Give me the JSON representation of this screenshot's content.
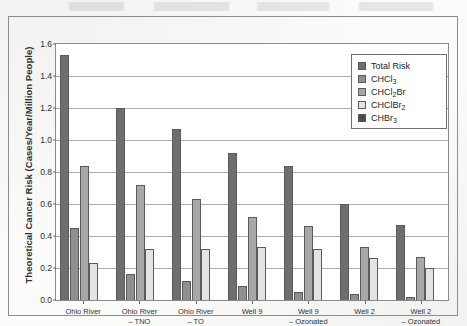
{
  "figure": {
    "y_axis_title": "Theoretical Cancer Risk (Cases/Year/Million People)"
  },
  "legend": {
    "entries": [
      {
        "label": "Total Risk",
        "label_main": "Total Risk",
        "sub": "",
        "label_tail": "",
        "color": "#6e6e6e"
      },
      {
        "label": "CHCl3",
        "label_main": "CHCl",
        "sub": "3",
        "label_tail": "",
        "color": "#8f8f8f"
      },
      {
        "label": "CHCl2Br",
        "label_main": "CHCl",
        "sub": "2",
        "label_tail": "Br",
        "color": "#a8a8a8"
      },
      {
        "label": "CHClBr2",
        "label_main": "CHClBr",
        "sub": "2",
        "label_tail": "",
        "color": "#e3e3e3"
      },
      {
        "label": "CHBr3",
        "label_main": "CHBr",
        "sub": "3",
        "label_tail": "",
        "color": "#4a4a4a"
      }
    ]
  },
  "y_ticks": [
    "0.0",
    "0.2",
    "0.4",
    "0.6",
    "0.8",
    "1.0",
    "1.2",
    "1.4",
    "1.6"
  ],
  "x_labels": [
    {
      "line1": "Ohio River",
      "line2": ""
    },
    {
      "line1": "Ohio River",
      "line2": "– TNO"
    },
    {
      "line1": "Ohio River",
      "line2": "– TO"
    },
    {
      "line1": "Well 9",
      "line2": ""
    },
    {
      "line1": "Well 9",
      "line2": "– Ozonated"
    },
    {
      "line1": "Well 2",
      "line2": ""
    },
    {
      "line1": "Well 2",
      "line2": "– Ozonated"
    }
  ],
  "chart_data": {
    "type": "bar",
    "title": "",
    "xlabel": "",
    "ylabel": "Theoretical Cancer Risk (Cases/Year/Million People)",
    "ylim": [
      0.0,
      1.6
    ],
    "ytick_step": 0.2,
    "grid": true,
    "legend_position": "upper right inside",
    "categories": [
      "Ohio River",
      "Ohio River – TNO",
      "Ohio River – TO",
      "Well 9",
      "Well 9 – Ozonated",
      "Well 2",
      "Well 2 – Ozonated"
    ],
    "series": [
      {
        "name": "Total Risk",
        "color": "#6e6e6e",
        "values": [
          1.53,
          1.2,
          1.07,
          0.92,
          0.84,
          0.6,
          0.47
        ]
      },
      {
        "name": "CHCl3",
        "color": "#8f8f8f",
        "values": [
          0.45,
          0.16,
          0.12,
          0.09,
          0.05,
          0.04,
          0.02
        ]
      },
      {
        "name": "CHCl2Br",
        "color": "#a8a8a8",
        "values": [
          0.84,
          0.72,
          0.63,
          0.52,
          0.46,
          0.33,
          0.27
        ]
      },
      {
        "name": "CHClBr2",
        "color": "#e3e3e3",
        "values": [
          0.23,
          0.32,
          0.32,
          0.33,
          0.32,
          0.26,
          0.2
        ]
      },
      {
        "name": "CHBr3",
        "color": "#4a4a4a",
        "values": [
          0.0,
          0.0,
          0.0,
          0.0,
          0.0,
          0.0,
          0.0
        ]
      }
    ]
  }
}
